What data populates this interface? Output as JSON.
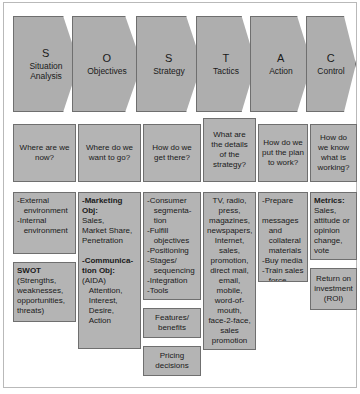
{
  "diagram": {
    "colors": {
      "chevron_fill": "#aeaeae",
      "box_fill": "#b4b4b4",
      "stroke": "#6f6f6f",
      "background": "#ffffff"
    },
    "stages": [
      {
        "letter": "S",
        "name": "Situation Analysis",
        "question": "Where are we now?"
      },
      {
        "letter": "O",
        "name": "Objectives",
        "question": "Where do we want to go?"
      },
      {
        "letter": "S",
        "name": "Strategy",
        "question": "How do we get there?"
      },
      {
        "letter": "T",
        "name": "Tactics",
        "question": "What are the details of the strategy?"
      },
      {
        "letter": "A",
        "name": "Action",
        "question": "How do we put the plan to work?"
      },
      {
        "letter": "C",
        "name": "Control",
        "question": "How do we know what is working?"
      }
    ],
    "details": {
      "situation": {
        "primary": [
          "-External",
          "   environment",
          "-Internal",
          "   environment"
        ],
        "secondary_header": "SWOT",
        "secondary": [
          "(Strengths,",
          "weaknesses,",
          "opportunities,",
          "threats)"
        ]
      },
      "objectives": {
        "marketing_header_line1": "-Marketing",
        "marketing_header_line2": "Obj:",
        "marketing_items": [
          "Sales,",
          "Market Share,",
          "Penetration"
        ],
        "communication_header_line1": "-Communica-",
        "communication_header_line2": "tion Obj:",
        "communication_items": [
          "(AIDA)",
          "   Attention,",
          "   Interest,",
          "   Desire,",
          "   Action"
        ]
      },
      "strategy": {
        "primary": [
          "-Consumer",
          "   segmenta-",
          "   tion",
          "-Fulfill",
          "   objectives",
          "-Positioning",
          "-Stages/",
          "   sequencing",
          "-Integration",
          "-Tools"
        ],
        "features_box": [
          "Features/",
          "benefits"
        ],
        "pricing_box": [
          "Pricing",
          "decisions"
        ]
      },
      "tactics": {
        "primary": [
          "TV, radio,",
          "press,",
          "magazines,",
          "newspapers,",
          "Internet,",
          "sales,",
          "promotion,",
          "direct mail,",
          "email,",
          "mobile,",
          "word-of-",
          "mouth,",
          "face-2-face,",
          "sales",
          "promotion"
        ]
      },
      "action": {
        "primary": [
          "-Prepare",
          "   messages",
          "   and",
          "   collateral",
          "   materials",
          "-Buy media",
          "-Train sales",
          "   force"
        ]
      },
      "control": {
        "metrics_header": "Metrics:",
        "metrics_items": [
          "Sales,",
          "attitude or",
          "opinion",
          "change,",
          "vote"
        ],
        "roi_box": [
          "Return on",
          "investment",
          "(ROI)"
        ]
      }
    }
  }
}
